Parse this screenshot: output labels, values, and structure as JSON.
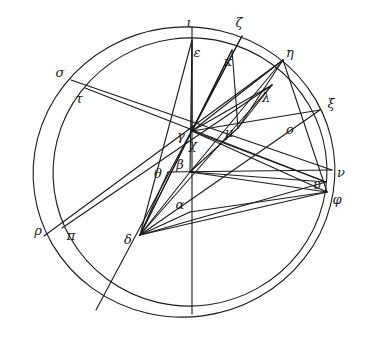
{
  "figure": {
    "ink_color": "#1a1a1a",
    "background_color": "#ffffff",
    "stroke_width": 1.1,
    "width": 365,
    "height": 340
  },
  "circles": [
    {
      "name": "outer-circle",
      "cx": 184,
      "cy": 172,
      "rx": 151,
      "ry": 145,
      "rotation": -8
    },
    {
      "name": "inner-circle",
      "cx": 190,
      "cy": 172,
      "rx": 137,
      "ry": 134,
      "rotation": -8
    }
  ],
  "points": [
    {
      "id": "alpha",
      "label": "α",
      "x": 190,
      "y": 212,
      "lx": 180,
      "ly": 204
    },
    {
      "id": "beta",
      "label": "β",
      "x": 190,
      "y": 172,
      "lx": 180,
      "ly": 164
    },
    {
      "id": "gamma",
      "label": "γ",
      "x": 192,
      "y": 131,
      "lx": 181,
      "ly": 135
    },
    {
      "id": "delta",
      "label": "δ",
      "x": 140,
      "y": 235,
      "lx": 128,
      "ly": 239
    },
    {
      "id": "epsilon",
      "label": "ε",
      "x": 192,
      "y": 40,
      "lx": 197,
      "ly": 52
    },
    {
      "id": "zeta",
      "label": "ζ",
      "x": 242,
      "y": 36,
      "lx": 239,
      "ly": 22
    },
    {
      "id": "eta",
      "label": "η",
      "x": 283,
      "y": 60,
      "lx": 290,
      "ly": 52
    },
    {
      "id": "theta",
      "label": "θ",
      "x": 168,
      "y": 172,
      "lx": 158,
      "ly": 173
    },
    {
      "id": "iota",
      "label": "ι",
      "x": 192,
      "y": 27,
      "lx": 189,
      "ly": 22
    },
    {
      "id": "kappa",
      "label": "κ",
      "x": 232,
      "y": 50,
      "lx": 228,
      "ly": 61
    },
    {
      "id": "lambda",
      "label": "λ",
      "x": 272,
      "y": 85,
      "lx": 266,
      "ly": 97
    },
    {
      "id": "mu",
      "label": "μ",
      "x": 238,
      "y": 128,
      "lx": 229,
      "ly": 132
    },
    {
      "id": "nu",
      "label": "ν",
      "x": 332,
      "y": 170,
      "lx": 341,
      "ly": 172
    },
    {
      "id": "xi",
      "label": "ξ",
      "x": 320,
      "y": 110,
      "lx": 331,
      "ly": 103
    },
    {
      "id": "omicron",
      "label": "o",
      "x": 283,
      "y": 133,
      "lx": 290,
      "ly": 129
    },
    {
      "id": "pi",
      "label": "π",
      "x": 62,
      "y": 228,
      "lx": 71,
      "ly": 235
    },
    {
      "id": "rho",
      "label": "ρ",
      "x": 44,
      "y": 236,
      "lx": 38,
      "ly": 230
    },
    {
      "id": "sigma",
      "label": "σ",
      "x": 71,
      "y": 80,
      "lx": 60,
      "ly": 72
    },
    {
      "id": "tau",
      "label": "τ",
      "x": 85,
      "y": 88,
      "lx": 79,
      "ly": 98
    },
    {
      "id": "upsilon",
      "label": "υ",
      "x": 326,
      "y": 182,
      "lx": 317,
      "ly": 184
    },
    {
      "id": "phi",
      "label": "φ",
      "x": 327,
      "y": 192,
      "lx": 337,
      "ly": 199
    },
    {
      "id": "chi",
      "label": "χ",
      "x": 198,
      "y": 141,
      "lx": 193,
      "ly": 144
    }
  ],
  "segments": [
    {
      "name": "iota-bottom-diameter",
      "from": "iota",
      "to_x": 192,
      "to_y": 314
    },
    {
      "name": "epsilon-to-delta",
      "from": "epsilon",
      "to": "delta"
    },
    {
      "name": "epsilon-to-beta",
      "from": "epsilon",
      "to": "beta"
    },
    {
      "name": "epsilon-to-gamma",
      "from": "epsilon",
      "to": "gamma"
    },
    {
      "name": "zeta-to-theta-ext",
      "from": "zeta",
      "to_x": 96,
      "to_y": 310
    },
    {
      "name": "sigma-to-nu",
      "from": "sigma",
      "to": "nu"
    },
    {
      "name": "tau-to-upsilon",
      "from": "tau",
      "to": "upsilon"
    },
    {
      "name": "rho-to-eta",
      "from": "rho",
      "to": "eta"
    },
    {
      "name": "pi-to-lambda",
      "from": "pi",
      "to": "lambda"
    },
    {
      "name": "gamma-to-xi",
      "from": "gamma",
      "to": "xi"
    },
    {
      "name": "gamma-to-eta",
      "from": "gamma",
      "to": "eta"
    },
    {
      "name": "gamma-to-lambda",
      "from": "gamma",
      "to": "lambda"
    },
    {
      "name": "gamma-to-kappa",
      "from": "gamma",
      "to": "kappa"
    },
    {
      "name": "gamma-to-zeta",
      "from": "gamma",
      "to": "zeta"
    },
    {
      "name": "gamma-to-delta",
      "from": "gamma",
      "to": "delta"
    },
    {
      "name": "gamma-to-phi",
      "from": "gamma",
      "to": "phi"
    },
    {
      "name": "gamma-to-upsilon",
      "from": "gamma",
      "to": "upsilon"
    },
    {
      "name": "theta-to-nu",
      "from": "theta",
      "to": "nu"
    },
    {
      "name": "theta-to-delta",
      "from": "theta",
      "to": "delta"
    },
    {
      "name": "beta-to-delta",
      "from": "beta",
      "to": "delta"
    },
    {
      "name": "beta-to-phi",
      "from": "beta",
      "to": "phi"
    },
    {
      "name": "beta-to-upsilon",
      "from": "beta",
      "to": "upsilon"
    },
    {
      "name": "beta-to-mu",
      "from": "beta",
      "to": "mu"
    },
    {
      "name": "beta-to-eta",
      "from": "beta",
      "to": "eta"
    },
    {
      "name": "alpha-to-delta",
      "from": "alpha",
      "to": "delta"
    },
    {
      "name": "alpha-to-phi",
      "from": "alpha",
      "to": "phi"
    },
    {
      "name": "delta-to-phi",
      "from": "delta",
      "to": "phi"
    },
    {
      "name": "delta-to-upsilon",
      "from": "delta",
      "to": "upsilon"
    },
    {
      "name": "delta-to-omicron-xi",
      "from": "delta",
      "to": "xi"
    },
    {
      "name": "delta-to-lambda",
      "from": "delta",
      "to": "lambda"
    },
    {
      "name": "delta-to-kappa",
      "from": "delta",
      "to": "kappa"
    },
    {
      "name": "eta-to-mu",
      "from": "eta",
      "to": "mu"
    },
    {
      "name": "eta-to-phi",
      "from": "eta",
      "to": "phi"
    },
    {
      "name": "lambda-to-mu",
      "from": "lambda",
      "to": "mu"
    },
    {
      "name": "kappa-to-mu",
      "from": "kappa",
      "to": "mu"
    }
  ]
}
